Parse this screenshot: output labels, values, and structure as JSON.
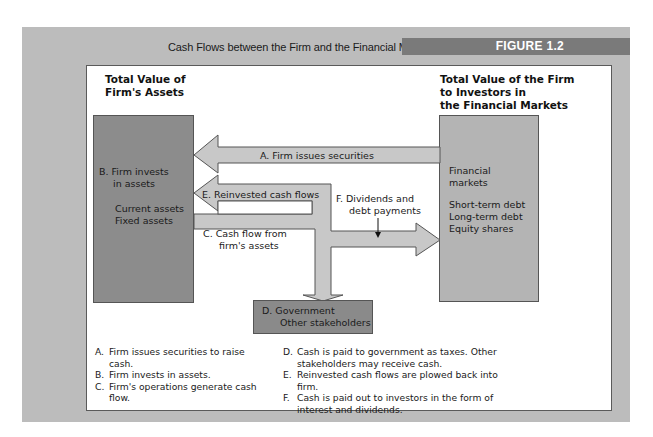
{
  "figure": {
    "caption": "Cash Flows between the Firm and the Financial Markets",
    "badge": "FIGURE 1.2"
  },
  "headings": {
    "left": "Total Value of Firm's Assets",
    "left_lines": [
      "Total Value of",
      "Firm's Assets"
    ],
    "right": "Total Value of the Firm to Investors in the Financial Markets",
    "right_lines": [
      "Total Value of the Firm",
      "to Investors in",
      "the Financial Markets"
    ]
  },
  "nodes": {
    "assets": {
      "label_lines": [
        "B. Firm invests",
        "in assets"
      ],
      "items": [
        "Current assets",
        "Fixed assets"
      ]
    },
    "markets": {
      "label_lines": [
        "Financial",
        "markets"
      ],
      "items": [
        "Short-term debt",
        "Long-term debt",
        "Equity shares"
      ]
    },
    "government": {
      "label_lines": [
        "D. Government",
        "Other stakeholders"
      ]
    }
  },
  "arrows": {
    "A": "A. Firm issues securities",
    "E": "E. Reinvested cash flows",
    "C_lines": [
      "C. Cash flow from",
      "firm's assets"
    ],
    "F_lines": [
      "F. Dividends and",
      "debt payments"
    ]
  },
  "legend": {
    "col1": [
      {
        "key": "A.",
        "text": "Firm issues securities to raise cash."
      },
      {
        "key": "B.",
        "text": "Firm invests in assets."
      },
      {
        "key": "C.",
        "text": "Firm's operations generate cash flow."
      }
    ],
    "col2": [
      {
        "key": "D.",
        "text": "Cash is paid to government as taxes. Other stakeholders may receive cash."
      },
      {
        "key": "E.",
        "text": "Reinvested cash flows are plowed back into firm."
      },
      {
        "key": "F.",
        "text": "Cash is paid out to investors in the form of interest and dividends."
      }
    ]
  },
  "colors": {
    "panel": "#bcbcbc",
    "badge": "#7a7a7a",
    "assets_box": "#8c8c8c",
    "markets_box": "#b4b4b4",
    "gov_box": "#8a8a8a",
    "arrow_fill": "#c8c8c8"
  }
}
